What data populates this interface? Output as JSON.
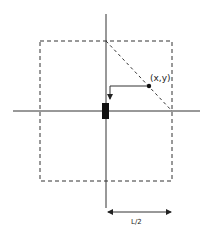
{
  "diagram": {
    "point_label": "(x,y)",
    "half_length_label": "L/2",
    "colors": {
      "stroke": "#333333",
      "fill_dark": "#111111",
      "background": "#ffffff"
    },
    "elements": {
      "axes": [
        "vertical-axis",
        "horizontal-axis"
      ],
      "boundary": "dashed-square",
      "diagonal": "dashed-diagonal",
      "marker": "black-rectangle",
      "point": "point-xy"
    }
  }
}
